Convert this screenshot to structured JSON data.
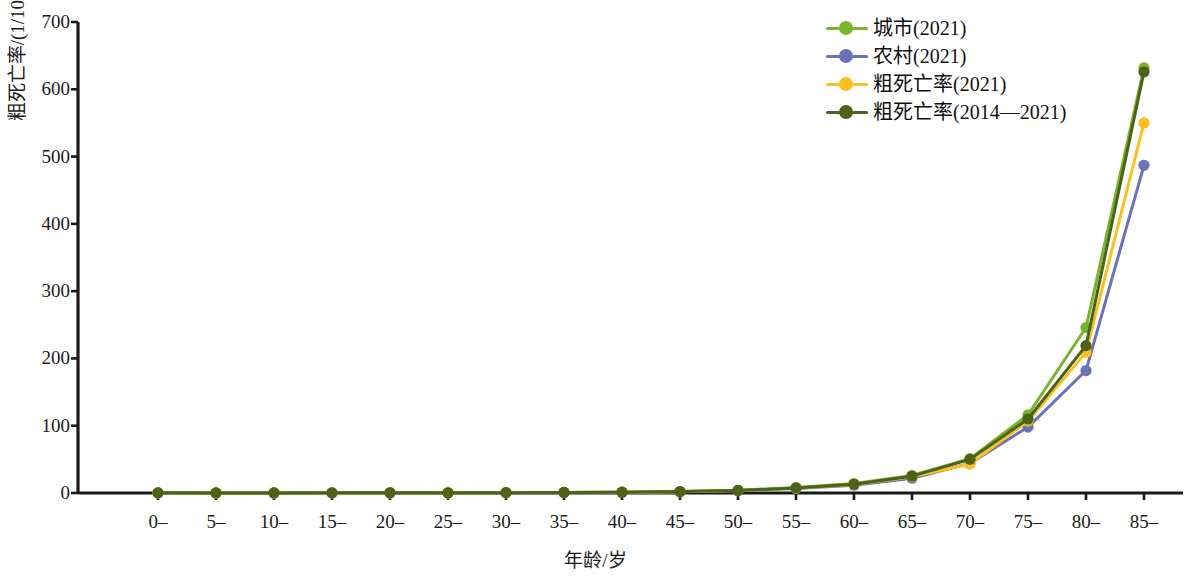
{
  "chart_data": {
    "type": "line",
    "title": "",
    "xlabel": "年龄/岁",
    "ylabel": "粗死亡率/(1/10万)",
    "categories": [
      "0–",
      "5–",
      "10–",
      "15–",
      "20–",
      "25–",
      "30–",
      "35–",
      "40–",
      "45–",
      "50–",
      "55–",
      "60–",
      "65–",
      "70–",
      "75–",
      "80–",
      "85–"
    ],
    "ylim": [
      0,
      700
    ],
    "yticks": [
      0,
      100,
      200,
      300,
      400,
      500,
      600,
      700
    ],
    "grid": false,
    "legend_position": "top-right",
    "series": [
      {
        "name": "城市(2021)",
        "color": "#7ab32e",
        "values": [
          0.2,
          0.1,
          0.1,
          0.2,
          0.3,
          0.3,
          0.5,
          0.8,
          1.3,
          2.2,
          4.0,
          8.0,
          14.0,
          26.0,
          51.0,
          116.0,
          246.0,
          632.0
        ]
      },
      {
        "name": "农村(2021)",
        "color": "#6b72b8",
        "values": [
          0.2,
          0.1,
          0.1,
          0.2,
          0.3,
          0.3,
          0.4,
          0.7,
          1.1,
          1.9,
          3.4,
          6.6,
          11.5,
          22.0,
          44.0,
          98.0,
          182.0,
          487.0
        ]
      },
      {
        "name": "粗死亡率(2021)",
        "color": "#fbc01f",
        "values": [
          0.2,
          0.1,
          0.1,
          0.2,
          0.3,
          0.3,
          0.45,
          0.75,
          1.2,
          2.0,
          3.6,
          7.2,
          12.5,
          24.0,
          43.0,
          107.0,
          209.0,
          550.0
        ]
      },
      {
        "name": "粗死亡率(2014—2021)",
        "color": "#4a6318",
        "values": [
          0.2,
          0.1,
          0.1,
          0.2,
          0.3,
          0.3,
          0.5,
          0.8,
          1.2,
          2.1,
          3.8,
          7.6,
          13.0,
          25.0,
          50.0,
          110.0,
          219.0,
          626.0
        ]
      }
    ]
  },
  "axes": {
    "y_title": "粗死亡率/(1/10万)",
    "x_title": "年龄/岁",
    "y_tick_labels": [
      "700",
      "600",
      "500",
      "400",
      "300",
      "200",
      "100",
      "0"
    ],
    "x_tick_labels": [
      "0–",
      "5–",
      "10–",
      "15–",
      "20–",
      "25–",
      "30–",
      "35–",
      "40–",
      "45–",
      "50–",
      "55–",
      "60–",
      "65–",
      "70–",
      "75–",
      "80–",
      "85–"
    ]
  },
  "legend": {
    "items": [
      {
        "label": "城市(2021)",
        "color": "#7ab32e"
      },
      {
        "label": "农村(2021)",
        "color": "#6b72b8"
      },
      {
        "label": "粗死亡率(2021)",
        "color": "#fbc01f"
      },
      {
        "label": "粗死亡率(2014—2021)",
        "color": "#4a6318"
      }
    ]
  },
  "colors": {
    "axis": "#1a1a1a",
    "background": "#ffffff"
  }
}
